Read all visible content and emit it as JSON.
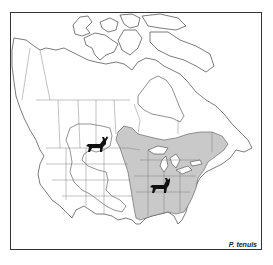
{
  "map": {
    "title": "P. tenuis",
    "region": "North America",
    "legend": {
      "shaded_area": "Range of P. tenuis (eastern North America)",
      "outlined_area": "Western region outline"
    },
    "icons": [
      {
        "name": "mule-deer-icon",
        "location": "western region (Montana/Saskatchewan area)"
      },
      {
        "name": "white-tailed-deer-icon",
        "location": "eastern shaded range (Missouri/Illinois area)"
      }
    ],
    "colors": {
      "range_fill": "#c9c9c9",
      "outline": "#444444",
      "background": "#ffffff",
      "deer": "#111111"
    }
  }
}
